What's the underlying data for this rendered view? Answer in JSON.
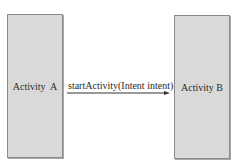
{
  "diagram": {
    "nodes": [
      {
        "id": "A",
        "label": "Activity  A"
      },
      {
        "id": "B",
        "label": "Activity B"
      }
    ],
    "edges": [
      {
        "from": "A",
        "to": "B",
        "label": "startActivity(Intent intent)"
      }
    ],
    "colors": {
      "box_fill": "#d9d9d9",
      "box_border": "#8a8a8a",
      "arrow": "#333333"
    }
  }
}
